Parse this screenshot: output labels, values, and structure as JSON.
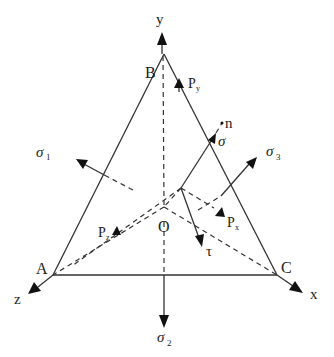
{
  "diagram": {
    "type": "stress tetrahedron with principal stresses",
    "axes": {
      "x": "x",
      "y": "y",
      "z": "z"
    },
    "vertices": {
      "A": "A",
      "B": "B",
      "C": "C",
      "O": "O"
    },
    "stresses": {
      "sigma1": "σ",
      "sigma1_sub": "1",
      "sigma2": "σ",
      "sigma2_sub": "2",
      "sigma3": "σ",
      "sigma3_sub": "3",
      "sigma_normal": "σ",
      "tau": "τ",
      "normal": "n"
    },
    "forces": {
      "Px": "P",
      "Px_sub": "x",
      "Py": "P",
      "Py_sub": "y",
      "Pz": "P",
      "Pz_sub": "z"
    },
    "colors": {
      "line": "#333333",
      "arrowhead": "#111111",
      "background": "#ffffff"
    }
  }
}
